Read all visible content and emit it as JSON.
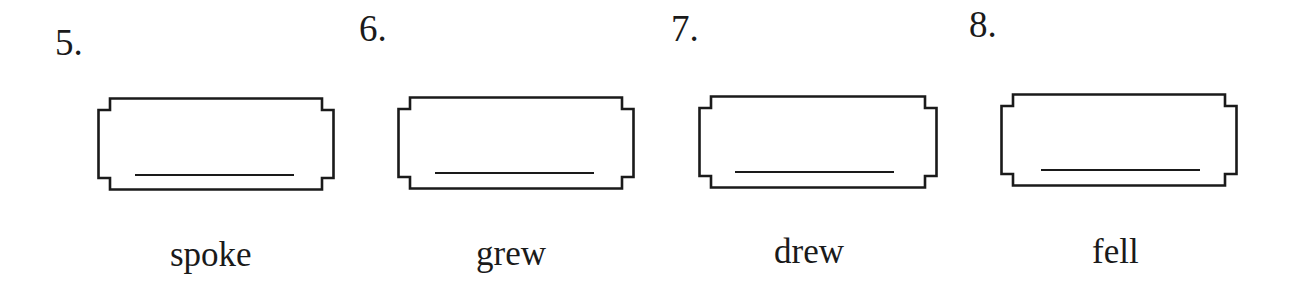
{
  "worksheet": {
    "items": [
      {
        "number": "5.",
        "word": "spoke",
        "answer": ""
      },
      {
        "number": "6.",
        "word": "grew",
        "answer": ""
      },
      {
        "number": "7.",
        "word": "drew",
        "answer": ""
      },
      {
        "number": "8.",
        "word": "fell",
        "answer": ""
      }
    ]
  },
  "colors": {
    "ink": "#1a1a1a",
    "background": "#ffffff"
  }
}
